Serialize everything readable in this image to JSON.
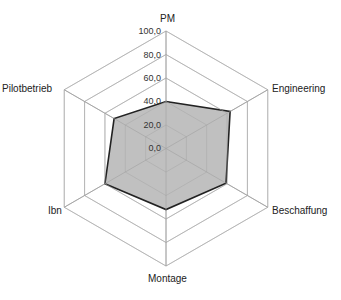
{
  "chart_data": {
    "type": "radar",
    "title": "",
    "categories": [
      "PM",
      "Engineering",
      "Beschaffung",
      "Montage",
      "Ibn",
      "Pilotbetrieb"
    ],
    "series": [
      {
        "name": "Bewertung",
        "values": [
          40,
          63,
          59,
          52,
          60,
          51
        ]
      }
    ],
    "rlim": [
      0,
      100
    ],
    "ticks": [
      "0,0",
      "20,0",
      "40,0",
      "60,0",
      "80,0",
      "100,0"
    ],
    "tick_values": [
      0,
      20,
      40,
      60,
      80,
      100
    ],
    "grid": true,
    "legend": "none",
    "colors": {
      "fill": "#c0c0c0",
      "line": "#222222",
      "grid": "#c8c8c8",
      "axis": "#b0b0b0"
    }
  },
  "labels": {
    "pm": "PM",
    "engineering": "Engineering",
    "beschaffung": "Beschaffung",
    "montage": "Montage",
    "ibn": "Ibn",
    "pilotbetrieb": "Pilotbetrieb"
  },
  "ticks": {
    "t0": "0,0",
    "t20": "20,0",
    "t40": "40,0",
    "t60": "60,0",
    "t80": "80,0",
    "t100": "100,0"
  }
}
